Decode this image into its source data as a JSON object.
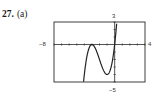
{
  "problem": {
    "number": "27.",
    "part": "(a)"
  },
  "chart_data": {
    "type": "line",
    "title": "",
    "xlabel": "",
    "ylabel": "",
    "xlim": [
      -8,
      4
    ],
    "ylim": [
      -5,
      3
    ],
    "grid": false,
    "legend": null,
    "tick_labels": {
      "x_min": "−8",
      "x_max": "4",
      "y_min": "−5",
      "y_max": "3"
    },
    "series": [
      {
        "name": "f(x)",
        "description": "cubic touching x-axis near x=-3, local min near x=-1 (y≈-4), crossing origin",
        "x": [
          -4.1,
          -4.0,
          -3.8,
          -3.5,
          -3.2,
          -3.0,
          -2.8,
          -2.5,
          -2.0,
          -1.5,
          -1.0,
          -0.5,
          0.0,
          0.1,
          0.2,
          0.27
        ],
        "y": [
          -5.0,
          -4.0,
          -2.56,
          -0.88,
          -0.13,
          0.0,
          -0.11,
          -0.63,
          -2.0,
          -3.38,
          -4.0,
          -3.13,
          0.0,
          0.96,
          2.05,
          2.95
        ]
      }
    ],
    "axes": {
      "x_tick_spacing": 1,
      "y_tick_spacing": 1
    }
  }
}
